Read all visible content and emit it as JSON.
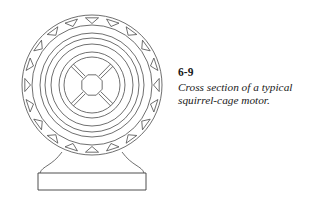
{
  "figure": {
    "number": "6-9",
    "caption_lines": [
      "Cross section of a typical",
      "squirrel-cage motor."
    ],
    "caption_full": "Cross section of a typical squirrel-cage motor."
  },
  "style": {
    "line_color": "#4a4a4a",
    "line_color_dark": "#3a3a3a",
    "background": "#ffffff",
    "fill": "none",
    "stroke_width": 0.8
  },
  "diagram": {
    "center_x": 92,
    "center_y": 85,
    "rings": [
      {
        "name": "stator-outer-frame",
        "radius": 70,
        "label": "outer frame"
      },
      {
        "name": "stator-slot-ring-outer",
        "radius": 60,
        "label": "slot ring outer"
      },
      {
        "name": "stator-core-outer",
        "radius": 52,
        "label": "stator core outer"
      },
      {
        "name": "stator-core-inner",
        "radius": 47,
        "label": "stator core inner"
      },
      {
        "name": "air-gap-ring",
        "radius": 41,
        "label": "air gap"
      },
      {
        "name": "rotor-outer",
        "radius": 33,
        "label": "rotor outer"
      },
      {
        "name": "rotor-inner",
        "radius": 28,
        "label": "rotor inner"
      }
    ],
    "slots": {
      "count": 20,
      "shape": "triangle",
      "orientation": "apex-inward",
      "filled": false,
      "ring_radius_outer": 70,
      "ring_radius_inner": 60
    },
    "hub": {
      "shape": "octagon",
      "radius": 11,
      "label": "shaft hub"
    },
    "spokes": {
      "count": 4,
      "angles_deg": [
        45,
        135,
        225,
        315
      ],
      "label": "rotor spokes"
    },
    "pedestal": {
      "support_top_left_x": 62,
      "support_top_right_x": 122,
      "base_left_x": 38,
      "base_right_x": 146,
      "base_top_y": 173,
      "base_bottom_y": 190,
      "label": "motor pedestal base"
    }
  }
}
